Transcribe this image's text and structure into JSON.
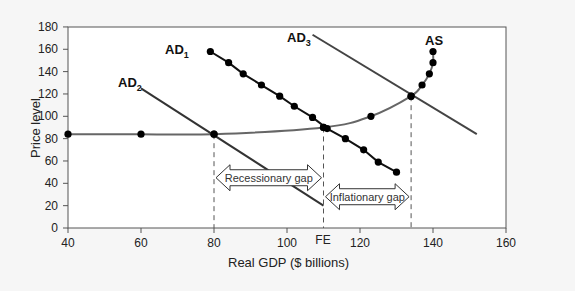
{
  "chart_data": {
    "type": "line",
    "title": "",
    "xlabel": "Real GDP ($ billions)",
    "ylabel": "Price level",
    "xlim": [
      40,
      160
    ],
    "ylim": [
      0,
      180
    ],
    "x_ticks": [
      40,
      60,
      80,
      100,
      120,
      140,
      160
    ],
    "y_ticks": [
      0,
      20,
      40,
      60,
      80,
      100,
      120,
      140,
      160,
      180
    ],
    "grid": false,
    "series": [
      {
        "name": "AS",
        "label": "AS",
        "style": "curve with dots",
        "color": "#666666",
        "points": [
          [
            40,
            84
          ],
          [
            60,
            84
          ],
          [
            80,
            84
          ],
          [
            110,
            90
          ],
          [
            123,
            100
          ],
          [
            134,
            118
          ],
          [
            137,
            128
          ],
          [
            139,
            138
          ],
          [
            140,
            148
          ],
          [
            140,
            158
          ]
        ]
      },
      {
        "name": "AD1",
        "label": "AD",
        "subscript": "1",
        "style": "line with dots",
        "color": "#111111",
        "points": [
          [
            79,
            158
          ],
          [
            84,
            148
          ],
          [
            88,
            138
          ],
          [
            93,
            128
          ],
          [
            98,
            118
          ],
          [
            102,
            109
          ],
          [
            107,
            99
          ],
          [
            111,
            89
          ],
          [
            116,
            80
          ],
          [
            121,
            70
          ],
          [
            125,
            59
          ],
          [
            130,
            50
          ]
        ]
      },
      {
        "name": "AD2",
        "label": "AD",
        "subscript": "2",
        "style": "line",
        "color": "#333333",
        "points": [
          [
            60,
            125
          ],
          [
            110,
            20
          ]
        ]
      },
      {
        "name": "AD3",
        "label": "AD",
        "subscript": "3",
        "style": "line",
        "color": "#444444",
        "points": [
          [
            107,
            173
          ],
          [
            152,
            84
          ]
        ]
      }
    ],
    "annotations": [
      {
        "text": "Recessionary gap",
        "type": "double-arrow",
        "x_from": 80,
        "x_to": 110,
        "y": 45
      },
      {
        "text": "Inflationary gap",
        "type": "double-arrow",
        "x_from": 110,
        "x_to": 134,
        "y": 28
      },
      {
        "text": "FE",
        "type": "x-axis-label",
        "x": 110
      },
      {
        "type": "dashed-vertical",
        "x": 80,
        "from_y": 84
      },
      {
        "type": "dashed-vertical",
        "x": 110,
        "from_y": 90
      },
      {
        "type": "dashed-vertical",
        "x": 134,
        "from_y": 118
      }
    ]
  },
  "labels": {
    "xlabel": "Real GDP ($ billions)",
    "ylabel": "Price level",
    "fe": "FE",
    "recessionary": "Recessionary gap",
    "inflationary": "Inflationary gap",
    "as": "AS",
    "ad": "AD",
    "ad1_sub": "1",
    "ad2_sub": "2",
    "ad3_sub": "3"
  }
}
